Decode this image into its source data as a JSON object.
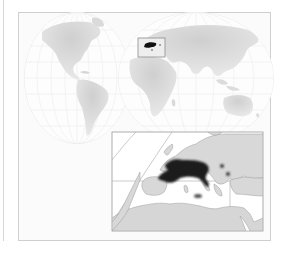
{
  "figure": {
    "type": "distribution-map",
    "world_map": {
      "projection": "interrupted-globe (two hemispheres)",
      "hemispheres": [
        "americas",
        "eurasia-africa-australia"
      ],
      "locator_box": {
        "region": "Western/Southern Europe & Mediterranean"
      }
    },
    "inset_map": {
      "region": "Europe & Mediterranean Basin",
      "highlighted_range": "France, northern Italy, Alps, central Europe (dark fill)",
      "outlying_points": [
        "Balkans (2 small spots)",
        "Sardinia/Corsica",
        "Sicily/Tunisia area"
      ]
    },
    "colors": {
      "land": "#d9d9d9",
      "land_light": "#e6e6e6",
      "sea": "#ffffff",
      "range": "#1e1e1e",
      "grid": "#e8e8e8",
      "border": "#9a9a9a"
    }
  }
}
